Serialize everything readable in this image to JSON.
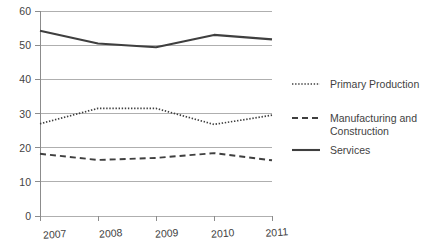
{
  "chart_data": {
    "type": "line",
    "title": "",
    "subtitle": "",
    "xlabel": "",
    "ylabel": "",
    "categories": [
      "2007",
      "2008",
      "2009",
      "2010",
      "2011"
    ],
    "x": [
      2007,
      2008,
      2009,
      2010,
      2011
    ],
    "xlim": [
      2007,
      2011
    ],
    "ylim": [
      0,
      60
    ],
    "y_ticks": [
      "0",
      "10",
      "20",
      "30",
      "40",
      "50",
      "60"
    ],
    "y_tick_values": [
      0,
      10,
      20,
      30,
      40,
      50,
      60
    ],
    "grid": "horizontal",
    "legend_position": "right",
    "series": [
      {
        "name": "Primary Production",
        "style": "dotted",
        "color": "#3f3f3f",
        "values": [
          27.0,
          31.5,
          31.5,
          26.8,
          29.5
        ]
      },
      {
        "name": "Manufacturing and Construction",
        "style": "dashed",
        "color": "#3f3f3f",
        "values": [
          18.2,
          16.4,
          17.0,
          18.4,
          16.3
        ]
      },
      {
        "name": "Services",
        "style": "solid",
        "color": "#3f3f3f",
        "values": [
          54.2,
          50.5,
          49.4,
          53.0,
          51.7
        ]
      }
    ]
  },
  "axis": {
    "y_labels": [
      "60",
      "50",
      "40",
      "30",
      "20",
      "10",
      "0"
    ],
    "x_labels": [
      "2007",
      "2008",
      "2009",
      "2010",
      "2011"
    ]
  },
  "legend": {
    "entries": [
      {
        "label": "Primary Production",
        "style": "dotted"
      },
      {
        "label": "Manufacturing and",
        "label2": "Construction",
        "style": "dashed"
      },
      {
        "label": "Services",
        "style": "solid"
      }
    ]
  },
  "colors": {
    "ink": "#3f3f3f",
    "grid": "#a6a6a6",
    "axis": "#8c8c8c",
    "background": "#ffffff"
  }
}
